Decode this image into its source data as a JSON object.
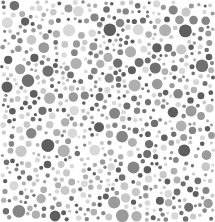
{
  "image": {
    "kind": "dot-pattern plate (grayscale, Ishihara-style)",
    "width": 215,
    "height": 222,
    "background": "#ffffff",
    "palette": [
      "#5e5e5e",
      "#707070",
      "#858585",
      "#9a9a9a",
      "#b0b0b0",
      "#c8c8c8",
      "#d8d8d8"
    ],
    "dot_radius_min": 1.5,
    "dot_radius_max": 6.5,
    "seed": 1337,
    "attempts": 9000
  }
}
